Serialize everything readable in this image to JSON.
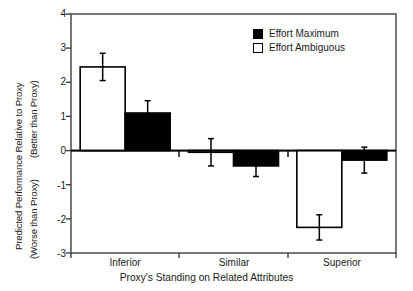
{
  "chart_data": {
    "type": "bar",
    "title": "",
    "subtitle": "",
    "xlabel": "Proxy's Standing on Related Attributes",
    "ylabel": "Predicted Performance Relative to Proxy",
    "ylabel_upper_note": "(Better than Proxy)",
    "ylabel_lower_note": "(Worse than Proxy)",
    "categories": [
      "Inferior",
      "Similar",
      "Superior"
    ],
    "series": [
      {
        "name": "Effort Ambiguous",
        "style": "open",
        "color": "#ffffff",
        "edge_color": "#000000",
        "values": [
          2.45,
          -0.05,
          -2.25
        ],
        "errors": [
          0.4,
          0.4,
          0.37
        ]
      },
      {
        "name": "Effort Maximum",
        "style": "filled",
        "color": "#000000",
        "edge_color": "#000000",
        "values": [
          1.1,
          -0.45,
          -0.28
        ],
        "errors": [
          0.36,
          0.31,
          0.38
        ]
      }
    ],
    "ylim": [
      -3,
      4
    ],
    "yticks": [
      4,
      3,
      2,
      1,
      0,
      -1,
      -2,
      -3
    ],
    "ytick_labels": [
      "4",
      "3",
      "2",
      "1",
      "0",
      "-1",
      "-2",
      "-3"
    ],
    "grid": false,
    "zero_line": true,
    "legend_position": "top-right",
    "legend_order": [
      "Effort Maximum",
      "Effort Ambiguous"
    ]
  },
  "legend": {
    "entries": [
      {
        "label": "Effort Maximum",
        "swatch": "filled-square-icon"
      },
      {
        "label": "Effort Ambiguous",
        "swatch": "open-square-icon"
      }
    ]
  },
  "axes": {
    "y_title_main": "Predicted Performance Relative to Proxy",
    "y_title_better": "(Better than Proxy)",
    "y_title_worse": "(Worse than Proxy)",
    "x_title": "Proxy's Standing on Related Attributes",
    "y_tick_labels": [
      "4",
      "3",
      "2",
      "1",
      "0",
      "-1",
      "-2",
      "-3"
    ],
    "x_tick_labels": [
      "Inferior",
      "Similar",
      "Superior"
    ]
  }
}
